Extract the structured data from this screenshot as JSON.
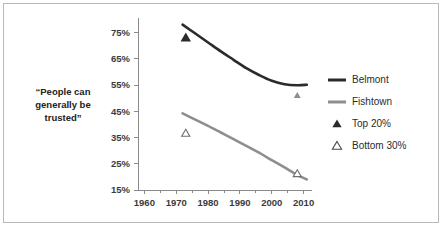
{
  "figure": {
    "background_color": "#ffffff",
    "border_color": "#b9b9b9"
  },
  "chart_data": {
    "type": "line",
    "title": "",
    "xlabel": "",
    "ylabel": "“People can generally be trusted”",
    "ylabel_lines": [
      "“People can",
      "generally be",
      "trusted”"
    ],
    "xlim": [
      1958,
      2012
    ],
    "ylim": [
      15,
      79
    ],
    "grid": false,
    "legend_position": "right",
    "x_ticks": [
      1960,
      1970,
      1980,
      1990,
      2000,
      2010
    ],
    "x_tick_labels": [
      "1960",
      "1970",
      "1980",
      "1990",
      "2000",
      "2010"
    ],
    "x_minor_ticks": [
      1965,
      1975,
      1985,
      1995,
      2005
    ],
    "y_ticks": [
      15,
      25,
      35,
      45,
      55,
      65,
      75
    ],
    "y_tick_labels": [
      "15%",
      "25%",
      "35%",
      "45%",
      "55%",
      "65%",
      "75%"
    ],
    "series": [
      {
        "name": "Belmont",
        "kind": "line",
        "color": "#2b2b2b",
        "width": 2.6,
        "x": [
          1972,
          1976,
          1980,
          1984,
          1988,
          1992,
          1996,
          2000,
          2004,
          2008,
          2011
        ],
        "values": [
          78.0,
          74.6,
          71.2,
          67.8,
          64.6,
          61.4,
          58.8,
          56.6,
          55.3,
          54.9,
          55.1
        ]
      },
      {
        "name": "Fishtown",
        "kind": "line",
        "color": "#8e8e8e",
        "width": 2.6,
        "x": [
          1972,
          1976,
          1980,
          1984,
          1988,
          1992,
          1996,
          2000,
          2004,
          2008,
          2011
        ],
        "values": [
          44.2,
          41.8,
          39.4,
          36.9,
          34.4,
          31.8,
          29.2,
          26.4,
          23.6,
          20.8,
          19.0
        ]
      }
    ],
    "markers": [
      {
        "name": "Top 20%",
        "kind": "triangle-filled",
        "color": "#2b2b2b",
        "points": [
          {
            "x": 1973,
            "y": 73.0,
            "size": 9
          },
          {
            "x": 2008,
            "y": 51.0,
            "size": 6,
            "color": "#8e8e8e"
          }
        ]
      },
      {
        "name": "Bottom 30%",
        "kind": "triangle-open",
        "color": "#6f6f6f",
        "points": [
          {
            "x": 1973,
            "y": 36.6,
            "size": 7
          },
          {
            "x": 2008,
            "y": 21.2,
            "size": 7
          }
        ]
      }
    ],
    "legend": [
      {
        "label": "Belmont",
        "kind": "line",
        "color": "#2b2b2b"
      },
      {
        "label": "Fishtown",
        "kind": "line",
        "color": "#8e8e8e"
      },
      {
        "label": "Top 20%",
        "kind": "triangle-filled",
        "color": "#2b2b2b"
      },
      {
        "label": "Bottom 30%",
        "kind": "triangle-open",
        "color": "#4a4a4a"
      }
    ]
  }
}
